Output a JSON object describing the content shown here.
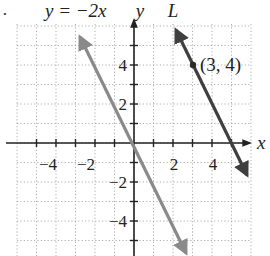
{
  "problem_marker": "·",
  "chart_data": {
    "type": "line",
    "title": "",
    "xlabel": "x",
    "ylabel": "y",
    "xlim": [
      -6,
      6
    ],
    "ylim": [
      -6,
      6
    ],
    "grid": true,
    "grid_style": "dotted",
    "x_ticks": [
      -4,
      -2,
      2,
      4
    ],
    "y_ticks": [
      4,
      2,
      -2,
      -4
    ],
    "x_tick_labels": [
      "−4",
      "−2",
      "2",
      "4"
    ],
    "y_tick_labels": [
      "4",
      "2",
      "−2",
      "−4"
    ],
    "series": [
      {
        "name": "y = −2x",
        "equation": "y = -2x",
        "slope": -2,
        "intercept": 0,
        "color": "#8a8a8a",
        "points": [
          [
            -2.6,
            5.2
          ],
          [
            0,
            0
          ],
          [
            2.6,
            -5.2
          ]
        ]
      },
      {
        "name": "L",
        "equation": "y = -2x + 10",
        "slope": -2,
        "intercept": 10,
        "color": "#3f3f3f",
        "points": [
          [
            2.1,
            5.8
          ],
          [
            3,
            4
          ],
          [
            5.6,
            -1.2
          ]
        ]
      }
    ],
    "annotations": [
      {
        "text": "(3, 4)",
        "x": 3,
        "y": 4,
        "marker": "dot"
      },
      {
        "text": "y = −2x",
        "position": "top-left-label"
      },
      {
        "text": "L",
        "position": "top-label"
      }
    ]
  },
  "labels": {
    "eq_label": "y = −2x",
    "line_L_label": "L",
    "x_axis": "x",
    "y_axis": "y",
    "point_label": "(3, 4)"
  },
  "colors": {
    "grid": "#9a9a9a",
    "axis": "#222222",
    "line1": "#8a8a8a",
    "line2": "#3f3f3f"
  }
}
